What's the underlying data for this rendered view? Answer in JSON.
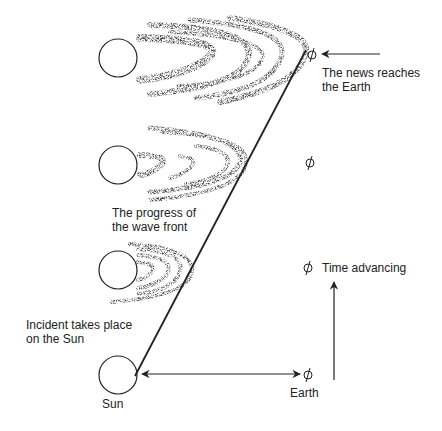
{
  "diagram": {
    "title": "",
    "labels": {
      "news_reaches": "The news reaches\nthe Earth",
      "wave_front": "The progress of\nthe wave front",
      "time_advancing": "Time advancing",
      "incident": "Incident takes place\non the Sun",
      "sun": "Sun",
      "earth": "Earth"
    },
    "colors": {
      "ink": "#222222",
      "stipple": "#555555",
      "background": "#ffffff"
    },
    "nodes": [
      {
        "id": "sun-t0",
        "type": "sun",
        "cx": 118,
        "cy": 375,
        "r": 19
      },
      {
        "id": "sun-t1",
        "type": "sun",
        "cx": 118,
        "cy": 270,
        "r": 19
      },
      {
        "id": "sun-t2",
        "type": "sun",
        "cx": 118,
        "cy": 165,
        "r": 19
      },
      {
        "id": "sun-t3",
        "type": "sun",
        "cx": 118,
        "cy": 58,
        "r": 19
      },
      {
        "id": "earth-t0",
        "type": "earth",
        "cx": 308,
        "cy": 375
      },
      {
        "id": "earth-t1",
        "type": "earth",
        "cx": 308,
        "cy": 268
      },
      {
        "id": "earth-t2",
        "type": "earth",
        "cx": 310,
        "cy": 163
      },
      {
        "id": "earth-t3",
        "type": "earth",
        "cx": 312,
        "cy": 55
      }
    ],
    "edges": [
      {
        "id": "wavefront-line",
        "from": [
          135,
          376
        ],
        "to": [
          306,
          50
        ],
        "style": "solid"
      },
      {
        "id": "sun-earth-distance",
        "from": [
          142,
          374
        ],
        "to": [
          300,
          374
        ],
        "style": "double-arrow"
      },
      {
        "id": "time-arrow",
        "from": [
          334,
          380
        ],
        "to": [
          334,
          282
        ],
        "style": "arrow"
      },
      {
        "id": "news-arrow",
        "from": [
          380,
          54
        ],
        "to": [
          322,
          54
        ],
        "style": "arrow"
      }
    ],
    "wavefronts": [
      {
        "sun": "sun-t1",
        "apex_x": 192,
        "rings": 4
      },
      {
        "sun": "sun-t2",
        "apex_x": 246,
        "rings": 4
      },
      {
        "sun": "sun-t3",
        "apex_x": 306,
        "rings": 5
      }
    ]
  }
}
